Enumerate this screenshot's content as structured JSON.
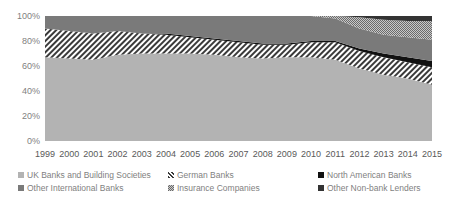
{
  "chart_data": {
    "type": "area",
    "stacked": true,
    "percent": true,
    "title": "",
    "xlabel": "",
    "ylabel": "",
    "ylim": [
      0,
      100
    ],
    "y_ticks": [
      "0%",
      "20%",
      "40%",
      "60%",
      "80%",
      "100%"
    ],
    "grid": false,
    "legend_position": "bottom",
    "categories": [
      "1999",
      "2000",
      "2001",
      "2002",
      "2003",
      "2004",
      "2005",
      "2006",
      "2007",
      "2008",
      "2009",
      "2010",
      "2011",
      "2012",
      "2013",
      "2014",
      "2015"
    ],
    "series": [
      {
        "name": "UK Banks and Building Societies",
        "color": "#b3b3b3",
        "pattern": "solid-light",
        "values": [
          67,
          66,
          65,
          69,
          70,
          70,
          70,
          69,
          67,
          66,
          67,
          67,
          65,
          58,
          53,
          50,
          45
        ]
      },
      {
        "name": "German Banks",
        "color": "#ffffff",
        "pattern": "diagonal-stripes",
        "values": [
          23,
          22,
          21,
          19,
          16,
          15,
          13,
          12,
          12,
          11,
          10,
          12,
          14,
          14,
          14,
          13,
          14
        ]
      },
      {
        "name": "North American Banks",
        "color": "#111111",
        "pattern": "solid-black",
        "values": [
          0,
          0,
          0,
          0,
          0,
          1,
          1,
          1,
          1,
          1,
          1,
          1,
          1,
          2,
          3,
          4,
          5
        ]
      },
      {
        "name": "Other International Banks",
        "color": "#7a7a7a",
        "pattern": "solid-dark",
        "values": [
          10,
          12,
          14,
          12,
          14,
          14,
          16,
          18,
          20,
          22,
          22,
          20,
          18,
          16,
          15,
          16,
          17
        ]
      },
      {
        "name": "Insurance Companies",
        "color": "#a0a0a0",
        "pattern": "checker",
        "values": [
          0,
          0,
          0,
          0,
          0,
          0,
          0,
          0,
          0,
          0,
          0,
          0,
          2,
          9,
          12,
          13,
          15
        ]
      },
      {
        "name": "Other Non-bank Lenders",
        "color": "#333333",
        "pattern": "solid-darkest",
        "values": [
          0,
          0,
          0,
          0,
          0,
          0,
          0,
          0,
          0,
          0,
          0,
          0,
          0,
          1,
          3,
          4,
          4
        ]
      }
    ]
  },
  "legend": {
    "items": [
      {
        "label": "UK Banks and Building Societies"
      },
      {
        "label": "German Banks"
      },
      {
        "label": "North American Banks"
      },
      {
        "label": "Other International Banks"
      },
      {
        "label": "Insurance Companies"
      },
      {
        "label": "Other Non-bank Lenders"
      }
    ]
  }
}
